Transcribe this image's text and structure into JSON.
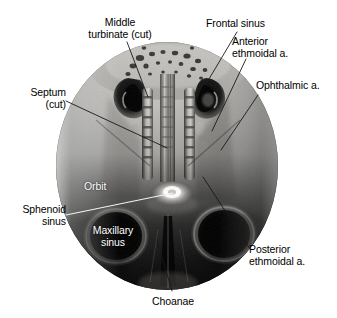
{
  "figure": {
    "shape": "oval",
    "image_style": "grayscale cadaveric / endoscopic photograph",
    "oval": {
      "cx": 167,
      "cy": 166,
      "rx": 111,
      "ry": 124
    },
    "background_color": "#ffffff",
    "label_color": "#000000",
    "inner_label_color": "#ffffff",
    "leader_color": "#16181a"
  },
  "labels": [
    {
      "id": "middle-turbinate",
      "text": "Middle\nturbinate (cut)",
      "align": "center",
      "x": 58,
      "y": 16,
      "width": 124,
      "placement": "outside-top-left"
    },
    {
      "id": "frontal-sinus",
      "text": "Frontal sinus",
      "align": "left",
      "x": 206,
      "y": 17,
      "width": 80,
      "placement": "outside-top-right"
    },
    {
      "id": "anterior-ethmoidal-a",
      "text": "Anterior\nethmoidal a.",
      "align": "left",
      "x": 232,
      "y": 35,
      "width": 76,
      "placement": "outside-top-right"
    },
    {
      "id": "ophthalmic-a",
      "text": "Ophthalmic a.",
      "align": "left",
      "x": 256,
      "y": 79,
      "width": 82,
      "placement": "outside-right"
    },
    {
      "id": "septum",
      "text": "Septum\n(cut)",
      "align": "right",
      "x": 8,
      "y": 86,
      "width": 62,
      "placement": "outside-left"
    },
    {
      "id": "orbit",
      "text": "Orbit",
      "align": "left",
      "x": 84,
      "y": 180,
      "width": 34,
      "placement": "inside-image",
      "inner": true
    },
    {
      "id": "sphenoid-sinus",
      "text": "Sphenoid\nsinus",
      "align": "right",
      "x": 4,
      "y": 203,
      "width": 62,
      "placement": "outside-left"
    },
    {
      "id": "maxillary-sinus",
      "text": "Maxillary\nsinus",
      "align": "center",
      "x": 78,
      "y": 224,
      "width": 70,
      "placement": "inside-image",
      "inner": true
    },
    {
      "id": "posterior-ethmoidal-a",
      "text": "Posterior\nethmoidal a.",
      "align": "left",
      "x": 249,
      "y": 243,
      "width": 80,
      "placement": "outside-bottom-right"
    },
    {
      "id": "choanae",
      "text": "Choanae",
      "align": "center",
      "x": 143,
      "y": 296,
      "width": 60,
      "placement": "outside-bottom"
    }
  ],
  "leader_lines": [
    {
      "id": "leader-middle-turbinate",
      "from": [
        127,
        42
      ],
      "to": [
        148,
        96
      ],
      "color": "black"
    },
    {
      "id": "leader-frontal-sinus",
      "from": [
        237,
        32
      ],
      "to": [
        208,
        78
      ],
      "color": "black"
    },
    {
      "id": "leader-anterior-ethmoidal",
      "from": [
        246,
        58
      ],
      "to": [
        212,
        130
      ],
      "color": "black"
    },
    {
      "id": "leader-ophthalmic",
      "from": [
        258,
        94
      ],
      "to": [
        222,
        149
      ],
      "color": "black"
    },
    {
      "id": "leader-septum",
      "from": [
        66,
        101
      ],
      "to": [
        166,
        147
      ],
      "color": "black"
    },
    {
      "id": "leader-sphenoid",
      "from": [
        66,
        214
      ],
      "to": [
        172,
        193
      ],
      "color": "white"
    },
    {
      "id": "leader-posterior-ethmoidal",
      "from": [
        250,
        248
      ],
      "to": [
        203,
        178
      ],
      "color": "black"
    },
    {
      "id": "leader-choanae",
      "from": [
        172,
        292
      ],
      "to": [
        157,
        240
      ],
      "color": "black"
    }
  ],
  "anatomy_regions": [
    {
      "id": "frontal-sinus-left-cavity",
      "note": "dark kidney-shaped cavity, upper left of midline"
    },
    {
      "id": "frontal-sinus-right-cavity",
      "note": "dark kidney-shaped cavity, upper right of midline"
    },
    {
      "id": "nasal-septum-midline",
      "note": "vertical pale ridge at midline"
    },
    {
      "id": "middle-turbinate-left",
      "note": "vertical segmented strip left of septum"
    },
    {
      "id": "middle-turbinate-right",
      "note": "vertical segmented strip right of septum"
    },
    {
      "id": "sphenoid-sinus-opening",
      "note": "bright oval highlight at center-lower midline"
    },
    {
      "id": "orbit-left",
      "note": "dark circular region lower left"
    },
    {
      "id": "orbit-right",
      "note": "dark circular region lower right"
    },
    {
      "id": "choanae-opening",
      "note": "dark vertical slot at inferior midline"
    }
  ]
}
